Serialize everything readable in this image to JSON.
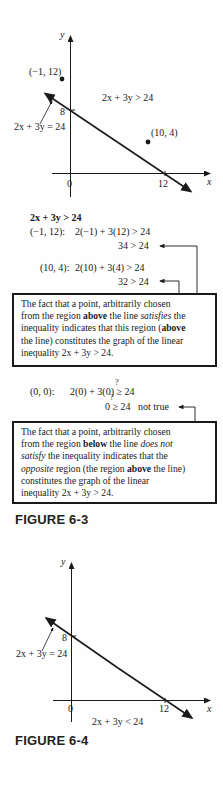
{
  "figure_6_3": {
    "graph": {
      "y_axis_label": "y",
      "x_axis_label": "x",
      "origin_label": "0",
      "x_intercept_label": "12",
      "y_intercept_label": "8",
      "line_label": "2x + 3y = 24",
      "region_label": "2x + 3y > 24",
      "points": [
        {
          "label": "(−1, 12)",
          "x": -1,
          "y": 12
        },
        {
          "label": "(10, 4)",
          "x": 10,
          "y": 4
        }
      ]
    },
    "work": {
      "heading": "2x + 3y > 24",
      "test1_point": "(−1, 12):",
      "test1_expr": "2(−1) + 3(12) > 24",
      "test1_result": "34 > 24",
      "test2_point": "(10, 4):",
      "test2_expr": "2(10) + 3(4) > 24",
      "test2_result": "32 > 24"
    },
    "box1": {
      "line1": "The fact that a point, arbitrarily chosen",
      "line2a": "from the region ",
      "line2b": "above",
      "line2c": " the line ",
      "line2d": "satisfies",
      "line2e": " the",
      "line3a": "inequality indicates that this region (",
      "line3b": "above",
      "line4": "the line) constitutes the graph of the linear",
      "line5": "inequality 2x + 3y > 24."
    },
    "work2": {
      "test_point": "(0, 0):",
      "test_expr": "2(0) + 3(0) ≥ 24",
      "question_mark": "?",
      "test_result": "0 ≥ 24",
      "verdict": "not true"
    },
    "box2": {
      "line1": "The fact that a point, arbitrarily chosen",
      "line2a": "from the region ",
      "line2b": "below",
      "line2c": " the line ",
      "line2d": "does not",
      "line3a": "satisfy",
      "line3b": " the inequality indicates that the",
      "line4a": "opposite",
      "line4b": " region (the region ",
      "line4c": "above",
      "line4d": " the line)",
      "line5": "constitutes the graph of the linear",
      "line6": "inequality 2x + 3y > 24."
    },
    "caption": "FIGURE 6-3"
  },
  "figure_6_4": {
    "graph": {
      "y_axis_label": "y",
      "x_axis_label": "x",
      "origin_label": "0",
      "x_intercept_label": "12",
      "y_intercept_label": "8",
      "line_label": "2x + 3y = 24",
      "region_label": "2x + 3y < 24"
    },
    "caption": "FIGURE 6-4"
  }
}
